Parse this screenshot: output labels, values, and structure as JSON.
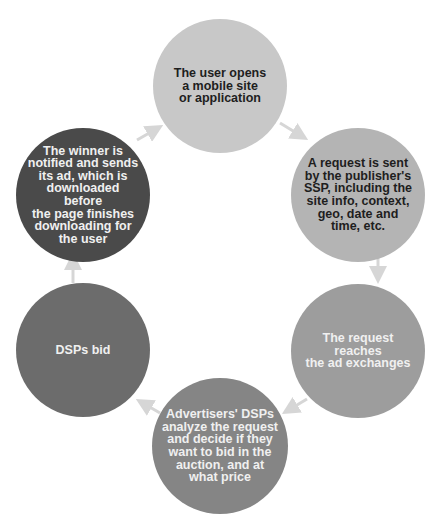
{
  "diagram": {
    "type": "cycle",
    "nodes": [
      {
        "id": "n1",
        "label": "The user opens\na mobile site\nor application",
        "fill": "#c8c8c8",
        "text_color": "#1e1e1e",
        "cx": 220,
        "cy": 86,
        "r": 67
      },
      {
        "id": "n2",
        "label": "A request is sent\nby the publisher's\nSSP, including the\nsite info, context,\ngeo, date and\ntime, etc.",
        "fill": "#b4b4b4",
        "text_color": "#1e1e1e",
        "cx": 358,
        "cy": 195,
        "r": 67
      },
      {
        "id": "n3",
        "label": "The request reaches\nthe ad exchanges",
        "fill": "#9d9d9d",
        "text_color": "#f0f0f0",
        "cx": 358,
        "cy": 351,
        "r": 67
      },
      {
        "id": "n4",
        "label": "Advertisers' DSPs\nanalyze the request\nand decide if they\nwant to bid in the\nauction, and at\nwhat price",
        "fill": "#858585",
        "text_color": "#f0f0f0",
        "cx": 220,
        "cy": 446,
        "r": 68
      },
      {
        "id": "n5",
        "label": "DSPs bid",
        "fill": "#6c6c6c",
        "text_color": "#f0f0f0",
        "cx": 83,
        "cy": 350,
        "r": 67
      },
      {
        "id": "n6",
        "label": "The winner is\nnotified and sends\nits ad, which is\ndownloaded before\nthe page finishes\ndownloading for\nthe user",
        "fill": "#4a4a4a",
        "text_color": "#f0f0f0",
        "cx": 83,
        "cy": 195,
        "r": 67
      }
    ],
    "edges": [
      {
        "from": "n1",
        "to": "n2"
      },
      {
        "from": "n2",
        "to": "n3"
      },
      {
        "from": "n3",
        "to": "n4"
      },
      {
        "from": "n4",
        "to": "n5"
      },
      {
        "from": "n5",
        "to": "n6"
      },
      {
        "from": "n6",
        "to": "n1"
      }
    ],
    "arrow_color": "#d6d6d6"
  }
}
